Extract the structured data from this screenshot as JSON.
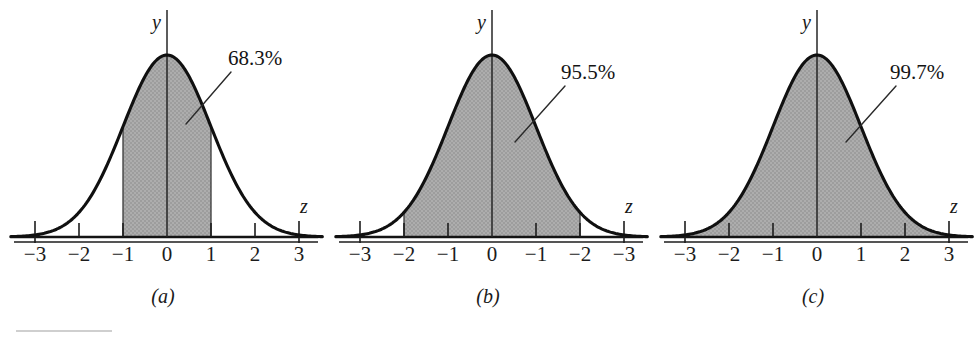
{
  "figure": {
    "background_color": "#ffffff",
    "curve_color": "#101010",
    "shade_color": "#a9a9a9",
    "axis_color": "#1d1d1d"
  },
  "chart_data": [
    {
      "type": "area",
      "title": "",
      "subtitle": "",
      "panel_label": "(a)",
      "xlabel": "z",
      "ylabel": "y",
      "xlim": [
        -3.55,
        3.55
      ],
      "ylim": [
        0,
        1.08
      ],
      "grid": false,
      "legend": "none",
      "distribution": "standard normal",
      "curve_formula": "y = exp(-z^2 / 2)",
      "tick_values": [
        -3,
        -2,
        -1,
        0,
        1,
        2,
        3
      ],
      "tick_labels": [
        "−3",
        "−2",
        "−1",
        "0",
        "1",
        "2",
        "3"
      ],
      "shaded_interval": [
        -1,
        1
      ],
      "shaded_label": "68.3%",
      "annotation": "68.3%",
      "x": [
        -3.5,
        -3.0,
        -2.5,
        -2.0,
        -1.5,
        -1.0,
        -0.5,
        0.0,
        0.5,
        1.0,
        1.5,
        2.0,
        2.5,
        3.0,
        3.5
      ],
      "y": [
        0.0022,
        0.0111,
        0.0439,
        0.1353,
        0.3247,
        0.6065,
        0.8825,
        1.0,
        0.8825,
        0.6065,
        0.3247,
        0.1353,
        0.0439,
        0.0111,
        0.0022
      ]
    },
    {
      "type": "area",
      "title": "",
      "subtitle": "",
      "panel_label": "(b)",
      "xlabel": "z",
      "ylabel": "y",
      "xlim": [
        -3.55,
        3.55
      ],
      "ylim": [
        0,
        1.08
      ],
      "grid": false,
      "legend": "none",
      "distribution": "standard normal",
      "curve_formula": "y = exp(-z^2 / 2)",
      "tick_values": [
        -3,
        -2,
        -1,
        0,
        1,
        2,
        3
      ],
      "tick_labels": [
        "−3",
        "−2",
        "−1",
        "0",
        "−1",
        "−2",
        "−3"
      ],
      "shaded_interval": [
        -2,
        2
      ],
      "shaded_label": "95.5%",
      "annotation": "95.5%",
      "x": [
        -3.5,
        -3.0,
        -2.5,
        -2.0,
        -1.5,
        -1.0,
        -0.5,
        0.0,
        0.5,
        1.0,
        1.5,
        2.0,
        2.5,
        3.0,
        3.5
      ],
      "y": [
        0.0022,
        0.0111,
        0.0439,
        0.1353,
        0.3247,
        0.6065,
        0.8825,
        1.0,
        0.8825,
        0.6065,
        0.3247,
        0.1353,
        0.0439,
        0.0111,
        0.0022
      ]
    },
    {
      "type": "area",
      "title": "",
      "subtitle": "",
      "panel_label": "(c)",
      "xlabel": "z",
      "ylabel": "y",
      "xlim": [
        -3.55,
        3.55
      ],
      "ylim": [
        0,
        1.08
      ],
      "grid": false,
      "legend": "none",
      "distribution": "standard normal",
      "curve_formula": "y = exp(-z^2 / 2)",
      "tick_values": [
        -3,
        -2,
        -1,
        0,
        1,
        2,
        3
      ],
      "tick_labels": [
        "−3",
        "−2",
        "−1",
        "0",
        "1",
        "2",
        "3"
      ],
      "shaded_interval": [
        -3,
        3
      ],
      "shaded_label": "99.7%",
      "annotation": "99.7%",
      "x": [
        -3.5,
        -3.0,
        -2.5,
        -2.0,
        -1.5,
        -1.0,
        -0.5,
        0.0,
        0.5,
        1.0,
        1.5,
        2.0,
        2.5,
        3.0,
        3.5
      ],
      "y": [
        0.0022,
        0.0111,
        0.0439,
        0.1353,
        0.3247,
        0.6065,
        0.8825,
        1.0,
        0.8825,
        0.6065,
        0.3247,
        0.1353,
        0.0439,
        0.0111,
        0.0022
      ]
    }
  ],
  "panels": {
    "a": {
      "caption": "(a)",
      "pct": "68.3%",
      "y_axis_name": "y",
      "z_axis_name": "z",
      "ticks": [
        "−3",
        "−2",
        "−1",
        "0",
        "1",
        "2",
        "3"
      ]
    },
    "b": {
      "caption": "(b)",
      "pct": "95.5%",
      "y_axis_name": "y",
      "z_axis_name": "z",
      "ticks": [
        "−3",
        "−2",
        "−1",
        "0",
        "−1",
        "−2",
        "−3"
      ]
    },
    "c": {
      "caption": "(c)",
      "pct": "99.7%",
      "y_axis_name": "y",
      "z_axis_name": "z",
      "ticks": [
        "−3",
        "−2",
        "−1",
        "0",
        "1",
        "2",
        "3"
      ]
    }
  }
}
